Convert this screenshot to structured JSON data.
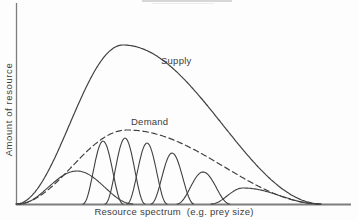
{
  "figure": {
    "y_axis_label": "Amount of resource",
    "x_axis_label": "Resource spectrum  (e.g. prey size)",
    "supply_label": "Supply",
    "demand_label": "Demand",
    "colors": {
      "curve": "#404040",
      "axis": "#7d7d7d",
      "background": "#fdfdfd",
      "text": "#3c3c3c"
    }
  },
  "chart_data": {
    "type": "line",
    "title": "",
    "xlabel": "Resource spectrum (e.g. prey size)",
    "ylabel": "Amount of resource",
    "grid": "off",
    "legend": "inline-labels",
    "axes": {
      "x_start_px": 16,
      "x_end_px": 351,
      "baseline_y_px": 204.5,
      "y_axis_top_px": 3,
      "axis_style": "plain lines, no ticks, no numeric scale (conceptual diagram)"
    },
    "curves": [
      {
        "name": "supply",
        "label": "Supply",
        "style": "solid",
        "stroke_width": 1.2,
        "center_x_px": 123,
        "peak_y_px": 45,
        "half_width_left_px": 107,
        "half_width_right_px": 199
      },
      {
        "name": "demand",
        "label": "Demand",
        "style": "dashed",
        "stroke_width": 1.2,
        "center_x_px": 127,
        "peak_y_px": 130,
        "half_width_left_px": 111,
        "half_width_right_px": 195
      },
      {
        "name": "species-utilization-1",
        "label": "",
        "style": "solid",
        "stroke_width": 1.1,
        "center_x_px": 77,
        "peak_y_px": 171,
        "half_width_left_px": 58,
        "half_width_right_px": 56
      },
      {
        "name": "species-utilization-2",
        "label": "",
        "style": "solid",
        "stroke_width": 1.1,
        "center_x_px": 103,
        "peak_y_px": 141,
        "half_width_left_px": 20,
        "half_width_right_px": 20
      },
      {
        "name": "species-utilization-3",
        "label": "",
        "style": "solid",
        "stroke_width": 1.1,
        "center_x_px": 125,
        "peak_y_px": 138,
        "half_width_left_px": 20,
        "half_width_right_px": 20
      },
      {
        "name": "species-utilization-4",
        "label": "",
        "style": "solid",
        "stroke_width": 1.1,
        "center_x_px": 147,
        "peak_y_px": 143,
        "half_width_left_px": 20,
        "half_width_right_px": 20
      },
      {
        "name": "species-utilization-5",
        "label": "",
        "style": "solid",
        "stroke_width": 1.1,
        "center_x_px": 172,
        "peak_y_px": 153,
        "half_width_left_px": 21,
        "half_width_right_px": 22
      },
      {
        "name": "species-utilization-6",
        "label": "",
        "style": "solid",
        "stroke_width": 1.1,
        "center_x_px": 203,
        "peak_y_px": 172,
        "half_width_left_px": 26,
        "half_width_right_px": 27
      },
      {
        "name": "species-utilization-7",
        "label": "",
        "style": "solid",
        "stroke_width": 1.1,
        "center_x_px": 243,
        "peak_y_px": 188,
        "half_width_left_px": 32,
        "half_width_right_px": 76
      }
    ]
  }
}
